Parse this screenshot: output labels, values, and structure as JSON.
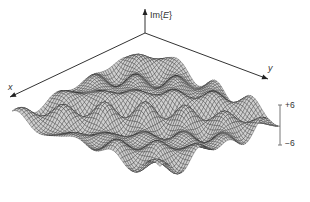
{
  "figure": {
    "type": "3d-surface-wireframe",
    "axes": {
      "z_label_prefix": "Im{",
      "z_label_var": "E",
      "z_label_suffix": "}",
      "x_label": "x",
      "y_label": "y"
    },
    "scale_bar": {
      "top_label": "+6",
      "bottom_label": "−6"
    },
    "colors": {
      "axis": "#333333",
      "mesh_line": "#2a2a2a",
      "mesh_fill": "#cfcfcf",
      "background": "#ffffff"
    },
    "geometry": {
      "origin": [
        145,
        33
      ],
      "x_axis_end": [
        10,
        97
      ],
      "y_axis_end": [
        268,
        79
      ],
      "z_axis_top": [
        145,
        9
      ],
      "surface_back": [
        145,
        50
      ],
      "surface_left": [
        12,
        118
      ],
      "surface_right": [
        280,
        120
      ],
      "surface_front": [
        160,
        172
      ],
      "amplitude_px": 14,
      "grid_n": 60
    }
  }
}
